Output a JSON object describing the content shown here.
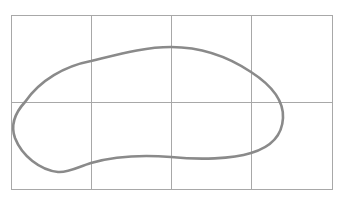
{
  "diagram": {
    "background": "#ffffff",
    "grid": {
      "color": "#a8a8a8",
      "stroke_width": 1,
      "left": 11,
      "top": 15,
      "right": 332,
      "bottom": 189,
      "columns": 4,
      "rows": 2,
      "vertical_lines_x": [
        11,
        91,
        171,
        251,
        332
      ],
      "horizontal_lines_y": [
        15,
        102,
        189
      ]
    },
    "closed_curve": {
      "shape": "bean / kidney-shaped closed loop",
      "color": "#8a8a8a",
      "stroke_width": 2.6,
      "fill": "none",
      "path": "M 25 102 C 40 80, 65 66, 91 61 C 120 54, 145 47, 171 47 C 205 47, 230 58, 251 72 C 268 83, 284 98, 283 118 C 282 138, 268 148, 251 153 C 232 159, 200 160, 171 157 C 145 155, 115 156, 91 163 C 78 167, 68 173, 58 172 C 40 170, 22 156, 15 138 C 11 127, 14 114, 25 102 Z"
    }
  }
}
